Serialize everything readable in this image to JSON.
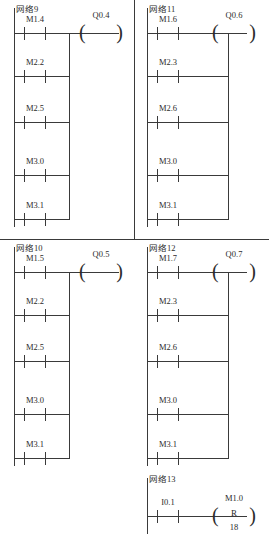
{
  "document": {
    "type": "plc-ladder-logic-diagram",
    "line_color": "#3a3a3a",
    "background": "#ffffff"
  },
  "separators": {
    "horizontal_label": "quadrant-horizontal-divider",
    "vertical_label": "quadrant-vertical-divider"
  },
  "networks": [
    {
      "id": "net9",
      "label": "网络9",
      "contacts": [
        "M1.4",
        "M2.2",
        "M2.5",
        "M3.0",
        "M3.1"
      ],
      "coil": {
        "label": "Q0.4",
        "inner": "",
        "sub": ""
      }
    },
    {
      "id": "net11",
      "label": "网络11",
      "contacts": [
        "M1.6",
        "M2.3",
        "M2.6",
        "M3.0",
        "M3.1"
      ],
      "coil": {
        "label": "Q0.6",
        "inner": "",
        "sub": ""
      }
    },
    {
      "id": "net10",
      "label": "网络10",
      "contacts": [
        "M1.5",
        "M2.2",
        "M2.5",
        "M3.0",
        "M3.1"
      ],
      "coil": {
        "label": "Q0.5",
        "inner": "",
        "sub": ""
      }
    },
    {
      "id": "net12",
      "label": "网络12",
      "contacts": [
        "M1.7",
        "M2.3",
        "M2.6",
        "M3.0",
        "M3.1"
      ],
      "coil": {
        "label": "Q0.7",
        "inner": "",
        "sub": ""
      }
    },
    {
      "id": "net13",
      "label": "网络13",
      "contacts": [
        "I0.1"
      ],
      "coil": {
        "label": "M1.0",
        "inner": "R",
        "sub": "18"
      }
    }
  ]
}
